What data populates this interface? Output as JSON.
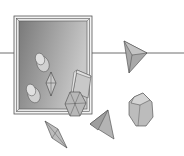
{
  "scene": {
    "description": "Illustration of a framed picture on a wall with scattered 3D crystal/polyhedron shapes",
    "colors": {
      "background": "#ffffff",
      "line": "#6e6e6e",
      "frame_outer": "#f2f2f2",
      "frame_stroke": "#555555",
      "canvas_dark": "#7a7a7a",
      "canvas_light": "#c4c4c4",
      "shape_fill": "#b8b8b8",
      "shape_light": "#d0d0d0",
      "shape_dark": "#9a9a9a"
    },
    "elements": [
      {
        "type": "horizontal-line"
      },
      {
        "type": "picture-frame"
      },
      {
        "type": "cylinder",
        "location": "inside-frame-upper"
      },
      {
        "type": "cylinder",
        "location": "inside-frame-lower"
      },
      {
        "type": "bipyramid",
        "location": "inside-frame-center"
      },
      {
        "type": "prism",
        "location": "frame-right-edge"
      },
      {
        "type": "hexagonal-prism",
        "location": "frame-bottom-right"
      },
      {
        "type": "tetrahedron",
        "location": "top-right"
      },
      {
        "type": "octagonal-prism",
        "location": "right"
      },
      {
        "type": "tetrahedron",
        "location": "bottom-center"
      },
      {
        "type": "bipyramid",
        "location": "bottom-left"
      }
    ]
  }
}
